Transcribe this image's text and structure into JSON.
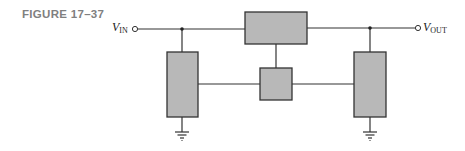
{
  "figure": {
    "label": "FIGURE 17–37"
  },
  "terminals": {
    "input": {
      "main": "V",
      "sub": "IN"
    },
    "output": {
      "main": "V",
      "sub": "OUT"
    }
  },
  "colors": {
    "block_fill": "#b8b8b8",
    "stroke": "#333333",
    "label_gray": "#808080"
  },
  "blocks": [
    {
      "id": "top-block",
      "x": 245,
      "y": 12,
      "w": 62,
      "h": 32
    },
    {
      "id": "left-block",
      "x": 167,
      "y": 52,
      "w": 31,
      "h": 65
    },
    {
      "id": "center-block",
      "x": 260,
      "y": 68,
      "w": 32,
      "h": 32
    },
    {
      "id": "right-block",
      "x": 354,
      "y": 52,
      "w": 32,
      "h": 65
    }
  ],
  "grounds": [
    {
      "id": "left-ground",
      "x": 182
    },
    {
      "id": "right-ground",
      "x": 370
    }
  ]
}
